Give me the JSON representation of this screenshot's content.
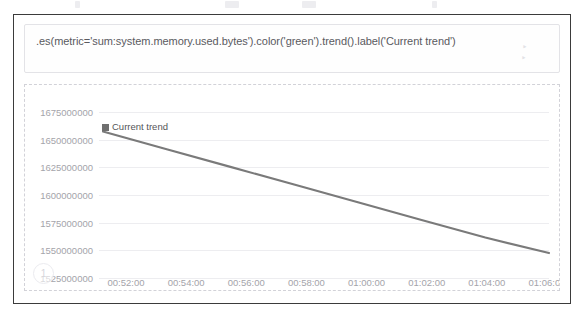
{
  "app": {
    "name": "timelion-expression-panel"
  },
  "expression": {
    "value": ".es(metric='sum:system.memory.used.bytes').color('green').trend().label('Current trend')",
    "placeholder": ".es(*)"
  },
  "chart_index_badge": "1",
  "legend": {
    "entries": [
      {
        "label": "Current trend",
        "color": "#6f6f6f"
      }
    ]
  },
  "colors": {
    "series": "#7a7a7a",
    "gridline": "#ededf0",
    "tick_text": "#a4a4aa",
    "panel_border": "#3b3b3b",
    "chart_border": "#d2d2d8"
  },
  "chart_data": {
    "type": "line",
    "title": "",
    "xlabel": "",
    "ylabel": "",
    "grid": true,
    "legend_position": "top-left",
    "x": [
      "00:52:00",
      "00:54:00",
      "00:56:00",
      "00:58:00",
      "01:00:00",
      "01:02:00",
      "01:04:00",
      "01:06:00"
    ],
    "xticks": [
      "00:52:00",
      "00:54:00",
      "00:56:00",
      "00:58:00",
      "01:00:00",
      "01:02:00",
      "01:04:00",
      "01:06:00"
    ],
    "yticks": [
      1675000000,
      1650000000,
      1625000000,
      1600000000,
      1575000000,
      1550000000,
      1525000000
    ],
    "ylim": [
      1520000000,
      1682000000
    ],
    "series": [
      {
        "name": "Current trend",
        "color": "#7a7a7a",
        "values": [
          1658000000,
          1642000000,
          1626000000,
          1610000000,
          1594000000,
          1578000000,
          1562000000,
          1548000000
        ]
      }
    ]
  }
}
